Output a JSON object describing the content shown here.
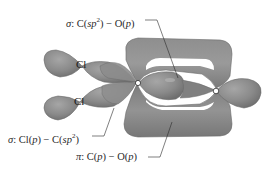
{
  "figure": {
    "colors": {
      "orbital_fill": "#8a8a8a",
      "orbital_highlight": "#a8a8a8",
      "orbital_shadow": "#6a6a6a",
      "line": "#2a2a2a",
      "background": "#ffffff",
      "atom_center": "#ffffff"
    },
    "atoms": [
      {
        "symbol": "Cl",
        "label": "Cl",
        "position": "upper-left"
      },
      {
        "symbol": "Cl",
        "label": "Cl",
        "position": "lower-left"
      },
      {
        "symbol": "C",
        "label": "",
        "position": "center"
      },
      {
        "symbol": "O",
        "label": "",
        "position": "right"
      }
    ],
    "annotations": [
      {
        "id": "sigma-c-o",
        "prefix": "σ",
        "text": "σ: C(sp²) − O(p)",
        "parts": {
          "greek": "σ",
          "a_atom": "C",
          "a_orb": "sp",
          "a_sup": "2",
          "b_atom": "O",
          "b_orb": "p"
        }
      },
      {
        "id": "sigma-cl-c",
        "prefix": "σ",
        "text": "σ: Cl(p) − C(sp²)",
        "parts": {
          "greek": "σ",
          "a_atom": "Cl",
          "a_orb": "p",
          "b_atom": "C",
          "b_orb": "sp",
          "b_sup": "2"
        }
      },
      {
        "id": "pi-c-o",
        "prefix": "π",
        "text": "π: C(p) − O(p)",
        "parts": {
          "greek": "π",
          "a_atom": "C",
          "a_orb": "p",
          "b_atom": "O",
          "b_orb": "p"
        }
      }
    ]
  }
}
